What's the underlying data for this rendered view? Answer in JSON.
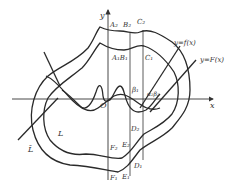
{
  "figure": {
    "axes": {
      "x_label": "x",
      "y_label": "y",
      "origin_label": "O"
    },
    "curves": {
      "f_label": "y=f(x)",
      "F_label": "y=F(x)",
      "inner_region_label": "L",
      "outer_region_label": "L̄"
    },
    "points_top": {
      "A2": "A₂",
      "B2": "B₂",
      "C2": "C₂",
      "A1B1": "A₁B₁",
      "C1": "C₁"
    },
    "points_mid": {
      "beta1": "β₁",
      "alpha2beta2": "α₂β₂"
    },
    "points_bottom": {
      "D2": "D₂",
      "E2": "E₂",
      "F2": "F₂",
      "D1": "D₁",
      "E1": "E₁",
      "F1": "F₁"
    }
  }
}
